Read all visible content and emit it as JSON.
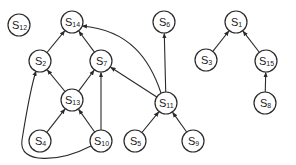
{
  "diagram": {
    "type": "directed-graph",
    "nodes": [
      {
        "id": "S12",
        "label": "S",
        "sub": "12",
        "x": 19,
        "y": 25
      },
      {
        "id": "S14",
        "label": "S",
        "sub": "14",
        "x": 72,
        "y": 22
      },
      {
        "id": "S2",
        "label": "S",
        "sub": "2",
        "x": 40,
        "y": 61
      },
      {
        "id": "S7",
        "label": "S",
        "sub": "7",
        "x": 101,
        "y": 61
      },
      {
        "id": "S13",
        "label": "S",
        "sub": "13",
        "x": 72,
        "y": 100
      },
      {
        "id": "S4",
        "label": "S",
        "sub": "4",
        "x": 40,
        "y": 141
      },
      {
        "id": "S10",
        "label": "S",
        "sub": "10",
        "x": 101,
        "y": 141
      },
      {
        "id": "S5",
        "label": "S",
        "sub": "5",
        "x": 135,
        "y": 141
      },
      {
        "id": "S11",
        "label": "S",
        "sub": "11",
        "x": 166,
        "y": 103
      },
      {
        "id": "S9",
        "label": "S",
        "sub": "9",
        "x": 193,
        "y": 141
      },
      {
        "id": "S6",
        "label": "S",
        "sub": "6",
        "x": 164,
        "y": 22
      },
      {
        "id": "S1",
        "label": "S",
        "sub": "1",
        "x": 236,
        "y": 22
      },
      {
        "id": "S3",
        "label": "S",
        "sub": "3",
        "x": 206,
        "y": 60
      },
      {
        "id": "S15",
        "label": "S",
        "sub": "15",
        "x": 266,
        "y": 61
      },
      {
        "id": "S8",
        "label": "S",
        "sub": "8",
        "x": 265,
        "y": 103
      }
    ],
    "edges": [
      {
        "from": "S2",
        "to": "S14"
      },
      {
        "from": "S7",
        "to": "S14"
      },
      {
        "from": "S11",
        "to": "S14",
        "curved": true
      },
      {
        "from": "S13",
        "to": "S2"
      },
      {
        "from": "S10",
        "to": "S2",
        "curved": true
      },
      {
        "from": "S13",
        "to": "S7"
      },
      {
        "from": "S10",
        "to": "S7"
      },
      {
        "from": "S11",
        "to": "S7"
      },
      {
        "from": "S4",
        "to": "S13"
      },
      {
        "from": "S10",
        "to": "S13"
      },
      {
        "from": "S5",
        "to": "S11"
      },
      {
        "from": "S9",
        "to": "S11"
      },
      {
        "from": "S11",
        "to": "S6"
      },
      {
        "from": "S3",
        "to": "S1"
      },
      {
        "from": "S15",
        "to": "S1"
      },
      {
        "from": "S8",
        "to": "S15"
      }
    ],
    "colors": {
      "stroke": "#2a2a2a",
      "background": "#ffffff"
    }
  }
}
